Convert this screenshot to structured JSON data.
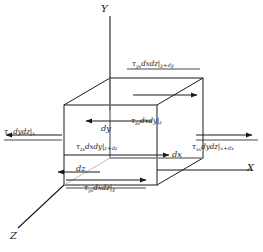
{
  "figure": {
    "type": "diagram",
    "axes": {
      "y_label": "Y",
      "x_label": "X",
      "z_label": "Z"
    },
    "dimensions": [
      {
        "id": "dy",
        "label": "dy"
      },
      {
        "id": "dx",
        "label": "dx"
      },
      {
        "id": "dz",
        "label": "dz"
      }
    ],
    "forces": [
      {
        "id": "tau-yx-top",
        "label": "τyxdxdz|y+dy",
        "tau": "τ",
        "sub": "yx",
        "mid": "dxdz",
        "eval": "y+dy",
        "direction": "right"
      },
      {
        "id": "tau-yx-bottom",
        "label": "τyxdxdz|y",
        "tau": "τ",
        "sub": "yx",
        "mid": "dxdz",
        "eval": "y",
        "direction": "right"
      },
      {
        "id": "tau-xx-left",
        "label": "τxxdydz|x",
        "tau": "τ",
        "sub": "xx",
        "mid": "dydz",
        "eval": "x",
        "direction": "left"
      },
      {
        "id": "tau-xx-right",
        "label": "τxxdydz|x+dx",
        "tau": "τ",
        "sub": "xx",
        "mid": "dydz",
        "eval": "x+dx",
        "direction": "right"
      },
      {
        "id": "tau-zx-back",
        "label": "τzxdxdy|z",
        "tau": "τ",
        "sub": "zx",
        "mid": "dxdy",
        "eval": "z",
        "direction": "left"
      },
      {
        "id": "tau-zx-front",
        "label": "τzxdxdy|z+dz",
        "tau": "τ",
        "sub": "zx",
        "mid": "dxdy",
        "eval": "z+dz",
        "direction": "right"
      }
    ],
    "colors": {
      "stroke": "#1a1a1a",
      "hidden_stroke": "#9a9a9a",
      "background": "#ffffff",
      "text": "#1a1a1a"
    }
  }
}
